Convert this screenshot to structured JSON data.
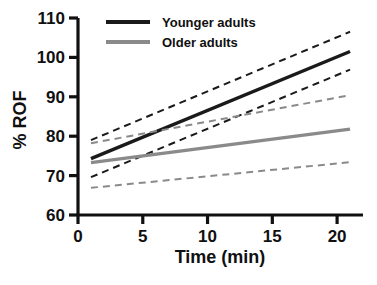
{
  "chart_data": {
    "type": "line",
    "title": "",
    "xlabel": "Time (min)",
    "ylabel": "% ROF",
    "xlim": [
      0,
      22
    ],
    "ylim": [
      60,
      110
    ],
    "xticks": [
      0,
      5,
      10,
      15,
      20
    ],
    "yticks": [
      60,
      70,
      80,
      90,
      100,
      110
    ],
    "xtick_labels": [
      "0",
      "5",
      "10",
      "15",
      "20"
    ],
    "ytick_labels": [
      "60",
      "70",
      "80",
      "90",
      "100",
      "110"
    ],
    "grid": false,
    "legend_position": "top-left-inside",
    "series": [
      {
        "name": "Younger adults",
        "style": "solid",
        "color": "#1a1a1a",
        "x": [
          1.0,
          21.0
        ],
        "values": [
          74.3,
          101.5
        ],
        "ci_upper": {
          "style": "dashed",
          "color": "#1a1a1a",
          "x": [
            1.0,
            21.0
          ],
          "values": [
            79.0,
            106.5
          ]
        },
        "ci_lower": {
          "style": "dashed",
          "color": "#1a1a1a",
          "x": [
            1.0,
            21.0
          ],
          "values": [
            69.6,
            96.9
          ]
        }
      },
      {
        "name": "Older adults",
        "style": "solid",
        "color": "#8a8a8a",
        "x": [
          1.0,
          21.0
        ],
        "values": [
          73.3,
          81.8
        ],
        "ci_upper": {
          "style": "dashed",
          "color": "#8a8a8a",
          "x": [
            1.0,
            21.0
          ],
          "values": [
            78.2,
            90.4
          ]
        },
        "ci_lower": {
          "style": "dashed",
          "color": "#8a8a8a",
          "x": [
            1.0,
            21.0
          ],
          "values": [
            66.9,
            73.4
          ]
        }
      }
    ],
    "legend": [
      {
        "label": "Younger adults",
        "color": "#1a1a1a"
      },
      {
        "label": "Older adults",
        "color": "#8a8a8a"
      }
    ]
  }
}
